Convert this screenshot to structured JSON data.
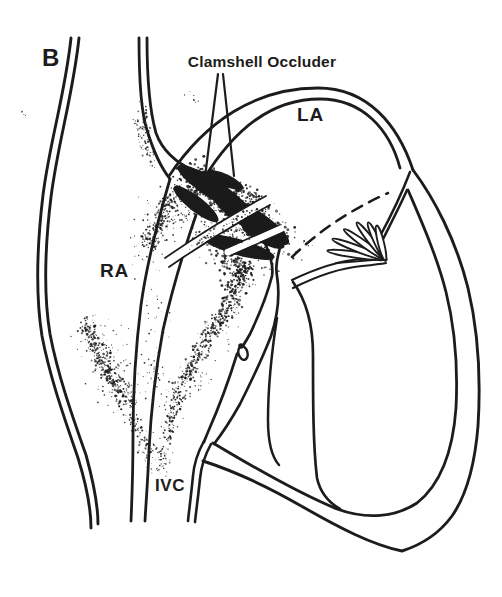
{
  "figure": {
    "panel_label": "B"
  },
  "annotations": {
    "device_label": "Clamshell Occluder"
  },
  "anatomy_labels": {
    "left_atrium": "LA",
    "right_atrium": "RA",
    "inferior_vena_cava": "IVC"
  },
  "style": {
    "ink_color": "#1c1c1c",
    "background_color": "#ffffff"
  }
}
